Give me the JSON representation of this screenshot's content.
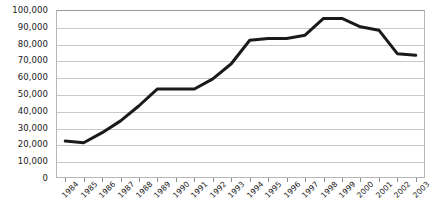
{
  "chart_data": {
    "type": "line",
    "title": "",
    "subtitle": "",
    "xlabel": "",
    "ylabel": "",
    "categories": [
      "1984",
      "1985",
      "1986",
      "1987",
      "1988",
      "1989",
      "1990",
      "1991",
      "1992",
      "1993",
      "1994",
      "1995",
      "1996",
      "1997",
      "1998",
      "1999",
      "2000",
      "2001",
      "2002",
      "2003"
    ],
    "x": [
      1984,
      1985,
      1986,
      1987,
      1988,
      1989,
      1990,
      1991,
      1992,
      1993,
      1994,
      1995,
      1996,
      1997,
      1998,
      1999,
      2000,
      2001,
      2002,
      2003
    ],
    "values": [
      22000,
      21000,
      27000,
      34000,
      43000,
      53000,
      53000,
      53000,
      59000,
      68000,
      82000,
      83000,
      83000,
      85000,
      95000,
      95000,
      90000,
      88000,
      74000,
      73000
    ],
    "series": [
      {
        "name": "",
        "values": [
          22000,
          21000,
          27000,
          34000,
          43000,
          53000,
          53000,
          53000,
          59000,
          68000,
          82000,
          83000,
          83000,
          85000,
          95000,
          95000,
          90000,
          88000,
          74000,
          73000
        ],
        "color": "#1a1a1a"
      }
    ],
    "ylim": [
      0,
      100000
    ],
    "y_ticks": [
      0,
      10000,
      20000,
      30000,
      40000,
      50000,
      60000,
      70000,
      80000,
      90000,
      100000
    ],
    "y_tick_labels": [
      "0",
      "10,000",
      "20,000",
      "30,000",
      "40,000",
      "50,000",
      "60,000",
      "70,000",
      "80,000",
      "90,000",
      "100,000"
    ],
    "grid": true,
    "grid_axis": "y",
    "legend": false,
    "legend_position": "none",
    "markers": false,
    "line_width": 3,
    "annotations": []
  },
  "colors": {
    "line": "#1a1a1a",
    "gridline": "#c9c9c9",
    "axis": "#9a9a9a",
    "plot_border": "#b6b6b6",
    "text": "#1a1a1a",
    "background": "#ffffff"
  }
}
